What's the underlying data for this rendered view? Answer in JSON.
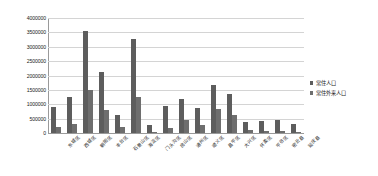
{
  "chart_data": {
    "type": "bar",
    "title": "",
    "xlabel": "",
    "ylabel": "",
    "ylim": [
      0,
      4000000
    ],
    "ytick_step": 500000,
    "grid": true,
    "legend_position": "right",
    "categories": [
      "东城区",
      "西城区",
      "朝阳区",
      "丰台区",
      "石景山区",
      "海淀区",
      "门头沟区",
      "房山区",
      "通州区",
      "顺义区",
      "昌平区",
      "大兴区",
      "怀柔区",
      "平谷区",
      "密云县",
      "延庆县"
    ],
    "yticks": [
      "0",
      "500000",
      "1000000",
      "1500000",
      "2000000",
      "2500000",
      "3000000",
      "3500000",
      "4000000"
    ],
    "series": [
      {
        "name": "常住人口",
        "color": "#5d5d5d",
        "values": [
          905000,
          1243000,
          3545000,
          2113000,
          614000,
          3281000,
          290000,
          945000,
          1184000,
          876000,
          1661000,
          1365000,
          373000,
          416000,
          468000,
          317000
        ]
      },
      {
        "name": "常住外来人口",
        "color": "#6e6e6e",
        "values": [
          198000,
          300000,
          1511000,
          806000,
          201000,
          1245000,
          45000,
          187000,
          437000,
          264000,
          846000,
          628000,
          100000,
          58000,
          70000,
          44000
        ]
      }
    ]
  }
}
